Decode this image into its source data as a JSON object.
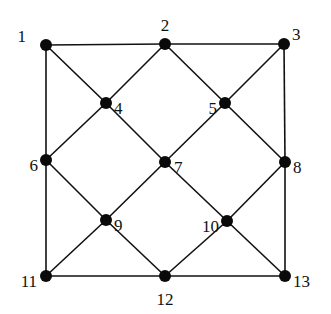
{
  "diagram": {
    "type": "graph",
    "colors": {
      "edge": "#111111",
      "node": "#0a0a0a",
      "background": "#ffffff"
    },
    "nodes": [
      {
        "id": "1",
        "label": "1",
        "x": 46,
        "y": 45,
        "lx": 26,
        "ly": 38,
        "anchor": "end"
      },
      {
        "id": "2",
        "label": "2",
        "x": 165,
        "y": 44,
        "lx": 165,
        "ly": 27,
        "anchor": "middle"
      },
      {
        "id": "3",
        "label": "3",
        "x": 284,
        "y": 44,
        "lx": 292,
        "ly": 36,
        "anchor": "start"
      },
      {
        "id": "4",
        "label": "4",
        "x": 106,
        "y": 103,
        "lx": 114,
        "ly": 110,
        "anchor": "start"
      },
      {
        "id": "5",
        "label": "5",
        "x": 225,
        "y": 103,
        "lx": 217,
        "ly": 110,
        "anchor": "end"
      },
      {
        "id": "6",
        "label": "6",
        "x": 46,
        "y": 160,
        "lx": 38,
        "ly": 167,
        "anchor": "end"
      },
      {
        "id": "7",
        "label": "7",
        "x": 165,
        "y": 162,
        "lx": 174,
        "ly": 169,
        "anchor": "start"
      },
      {
        "id": "8",
        "label": "8",
        "x": 285,
        "y": 162,
        "lx": 293,
        "ly": 169,
        "anchor": "start"
      },
      {
        "id": "9",
        "label": "9",
        "x": 106,
        "y": 220,
        "lx": 114,
        "ly": 227,
        "anchor": "start"
      },
      {
        "id": "10",
        "label": "10",
        "x": 227,
        "y": 221,
        "lx": 219,
        "ly": 228,
        "anchor": "end"
      },
      {
        "id": "11",
        "label": "11",
        "x": 46,
        "y": 276,
        "lx": 37,
        "ly": 283,
        "anchor": "end"
      },
      {
        "id": "12",
        "label": "12",
        "x": 165,
        "y": 276,
        "lx": 165,
        "ly": 301,
        "anchor": "middle"
      },
      {
        "id": "13",
        "label": "13",
        "x": 285,
        "y": 276,
        "lx": 293,
        "ly": 283,
        "anchor": "start"
      }
    ],
    "edges": [
      [
        "1",
        "2"
      ],
      [
        "2",
        "3"
      ],
      [
        "11",
        "12"
      ],
      [
        "12",
        "13"
      ],
      [
        "1",
        "6"
      ],
      [
        "6",
        "11"
      ],
      [
        "3",
        "8"
      ],
      [
        "8",
        "13"
      ],
      [
        "1",
        "4"
      ],
      [
        "4",
        "7"
      ],
      [
        "7",
        "10"
      ],
      [
        "10",
        "13"
      ],
      [
        "3",
        "5"
      ],
      [
        "5",
        "7"
      ],
      [
        "7",
        "9"
      ],
      [
        "9",
        "11"
      ],
      [
        "2",
        "4"
      ],
      [
        "4",
        "6"
      ],
      [
        "2",
        "5"
      ],
      [
        "5",
        "8"
      ],
      [
        "6",
        "9"
      ],
      [
        "9",
        "12"
      ],
      [
        "8",
        "10"
      ],
      [
        "10",
        "12"
      ]
    ]
  }
}
